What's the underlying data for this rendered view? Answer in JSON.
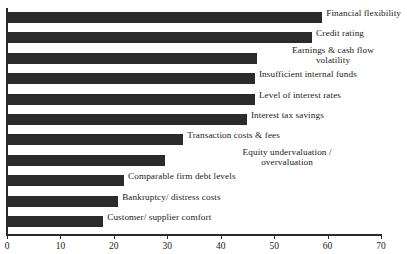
{
  "chart_data": {
    "type": "bar",
    "orientation": "horizontal",
    "title": "",
    "subtitle": "",
    "xlabel": "",
    "ylabel": "",
    "xlim": [
      0,
      70
    ],
    "grid": false,
    "legend": false,
    "bar_color": "#2b2b2b",
    "axis_color": "#2b2b2b",
    "xticks": [
      0,
      10,
      20,
      30,
      40,
      50,
      60,
      70
    ],
    "xtick_labels": [
      "0",
      "10",
      "20",
      "30",
      "40",
      "50",
      "60",
      "70"
    ],
    "categories": [
      "Financial flexibility",
      "Credit rating",
      "Earnings & cash flow volatility",
      "Insufficient internal funds",
      "Level of interest rates",
      "Interest tax savings",
      "Transaction costs & fees",
      "Equity undervaluation / overvaluation",
      "Comparable firm debt levels",
      "Bankruptcy/ distress costs",
      "Customer/ supplier comfort"
    ],
    "values": [
      59.0,
      57.1,
      46.8,
      46.4,
      46.4,
      44.9,
      33.0,
      29.6,
      21.9,
      20.8,
      18.0
    ],
    "bars": [
      {
        "label": "Financial flexibility",
        "label_lines": [
          "Financial flexibility"
        ],
        "value": 59.0
      },
      {
        "label": "Credit rating",
        "label_lines": [
          "Credit rating"
        ],
        "value": 57.1
      },
      {
        "label": "Earnings & cash flow volatility",
        "label_lines": [
          "Earnings & cash flow",
          "volatility"
        ],
        "value": 46.8
      },
      {
        "label": "Insufficient internal funds",
        "label_lines": [
          "Insufficient internal funds"
        ],
        "value": 46.4
      },
      {
        "label": "Level of interest rates",
        "label_lines": [
          "Level of interest rates"
        ],
        "value": 46.4
      },
      {
        "label": "Interest tax savings",
        "label_lines": [
          "Interest tax savings"
        ],
        "value": 44.9
      },
      {
        "label": "Transaction costs & fees",
        "label_lines": [
          "Transaction costs & fees"
        ],
        "value": 33.0
      },
      {
        "label": "Equity undervaluation / overvaluation",
        "label_lines": [
          "Equity undervaluation /",
          "overvaluation"
        ],
        "value": 29.6
      },
      {
        "label": "Comparable firm debt levels",
        "label_lines": [
          "Comparable firm debt levels"
        ],
        "value": 21.9
      },
      {
        "label": "Bankruptcy/ distress costs",
        "label_lines": [
          "Bankruptcy/ distress costs"
        ],
        "value": 20.8
      },
      {
        "label": "Customer/ supplier comfort",
        "label_lines": [
          "Customer/ supplier comfort"
        ],
        "value": 18.0
      }
    ]
  }
}
